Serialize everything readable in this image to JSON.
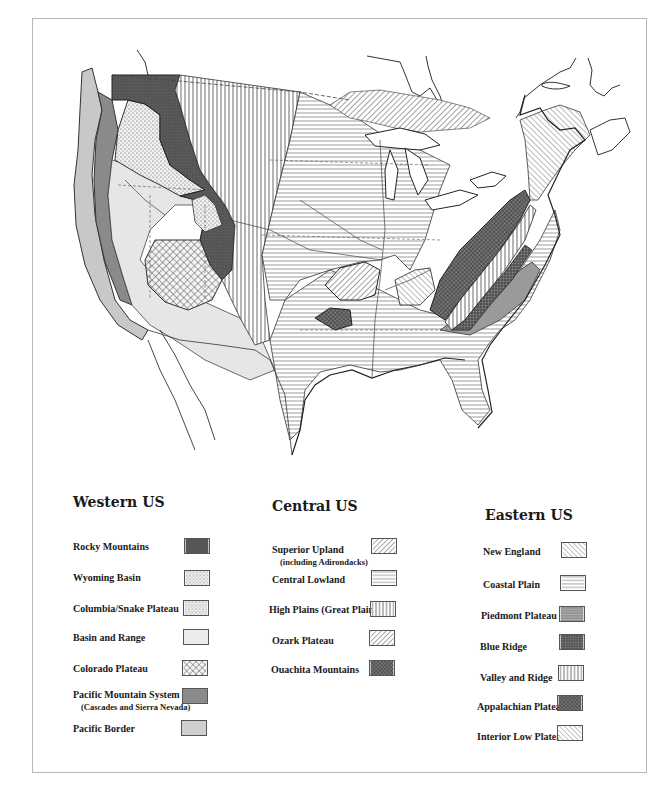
{
  "map": {
    "subject": "Physiographic provinces of the contiguous United States",
    "colors": {
      "background": "#ffffff",
      "outline": "#222222",
      "rocky_mountains": "#5a5a5a",
      "pacific_mountain": "#8a8a8a",
      "pacific_border": "#c8c8c8",
      "basin_range": "#e6e6e6",
      "appalachian_plateau": "#6a6a6a",
      "piedmont": "#9a9a9a"
    }
  },
  "legend": {
    "western": {
      "title": "Western US",
      "items": [
        {
          "label": "Rocky Mountains",
          "sub": "",
          "pattern": "dark-stipple"
        },
        {
          "label": "Wyoming Basin",
          "sub": "",
          "pattern": "light-dots"
        },
        {
          "label": "Columbia/Snake Plateau",
          "sub": "",
          "pattern": "dots"
        },
        {
          "label": "Basin and Range",
          "sub": "",
          "pattern": "light-gray"
        },
        {
          "label": "Colorado Plateau",
          "sub": "",
          "pattern": "crosshatch"
        },
        {
          "label": "Pacific Mountain System",
          "sub": "(Cascades and Sierra Nevada)",
          "pattern": "medium-gray"
        },
        {
          "label": "Pacific Border",
          "sub": "",
          "pattern": "pale-gray"
        }
      ]
    },
    "central": {
      "title": "Central US",
      "items": [
        {
          "label": "Superior Upland",
          "sub": "(including Adirondacks)",
          "pattern": "diagonal-right"
        },
        {
          "label": "Central Lowland",
          "sub": "",
          "pattern": "horizontal-broken"
        },
        {
          "label": "High Plains (Great Plains)",
          "sub": "",
          "pattern": "vertical"
        },
        {
          "label": "Ozark Plateau",
          "sub": "",
          "pattern": "diagonal-right"
        },
        {
          "label": "Ouachita Mountains",
          "sub": "",
          "pattern": "dense-crosshatch"
        }
      ]
    },
    "eastern": {
      "title": "Eastern US",
      "items": [
        {
          "label": "New England",
          "sub": "",
          "pattern": "diagonal-left"
        },
        {
          "label": "Coastal Plain",
          "sub": "",
          "pattern": "horizontal"
        },
        {
          "label": "Piedmont Plateau",
          "sub": "",
          "pattern": "horizontal-gray"
        },
        {
          "label": "Blue Ridge",
          "sub": "",
          "pattern": "grid-dark"
        },
        {
          "label": "Valley and Ridge",
          "sub": "",
          "pattern": "vertical"
        },
        {
          "label": "Appalachian Plateau",
          "sub": "",
          "pattern": "dense-crosshatch"
        },
        {
          "label": "Interior Low Plateau",
          "sub": "",
          "pattern": "diagonal-left-dense"
        }
      ]
    }
  }
}
